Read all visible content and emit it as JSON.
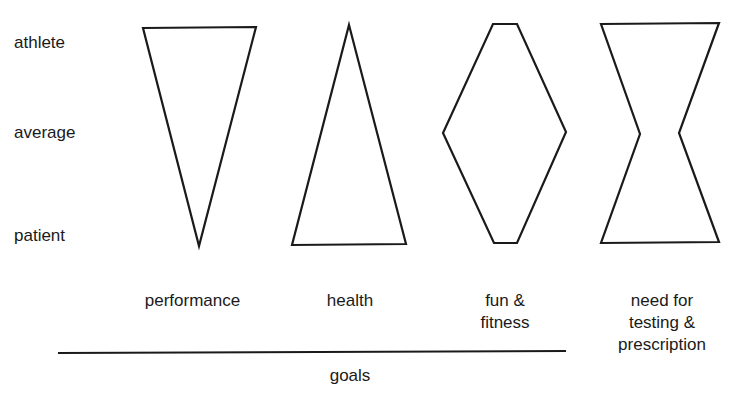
{
  "levels": [
    {
      "label": "athlete"
    },
    {
      "label": "average"
    },
    {
      "label": "patient"
    }
  ],
  "goals": [
    {
      "label": "performance",
      "shape": "inverted-triangle"
    },
    {
      "label": "health",
      "shape": "triangle"
    },
    {
      "label": "fun & fitness",
      "line1": "fun &",
      "line2": "fitness",
      "shape": "diamond"
    },
    {
      "label": "need for testing & prescription",
      "line1": "need for",
      "line2": "testing &",
      "line3": "prescription",
      "shape": "hourglass"
    }
  ],
  "axis": {
    "label": "goals"
  },
  "colors": {
    "stroke": "#1a1a1a",
    "background": "#ffffff"
  }
}
